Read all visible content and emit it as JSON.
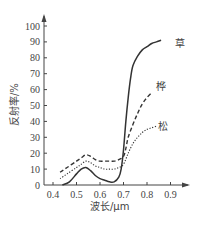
{
  "chart_data": {
    "type": "line",
    "title": "",
    "xlabel": "波长/μm",
    "ylabel": "反射率/%",
    "xlim": [
      0.4,
      0.9
    ],
    "ylim": [
      0,
      100
    ],
    "x_ticks": [
      "0.4",
      "0.5",
      "0.6",
      "0.7",
      "0.8",
      "0.9"
    ],
    "y_ticks": [
      "0",
      "10",
      "20",
      "30",
      "40",
      "50",
      "60",
      "70",
      "80",
      "90",
      "100"
    ],
    "grid": false,
    "legend_position": "inline labels at line ends",
    "series": [
      {
        "name": "草",
        "style": "solid",
        "x": [
          0.44,
          0.47,
          0.5,
          0.52,
          0.54,
          0.56,
          0.58,
          0.6,
          0.62,
          0.64,
          0.66,
          0.68,
          0.69,
          0.7,
          0.71,
          0.72,
          0.73,
          0.74,
          0.76,
          0.78,
          0.8,
          0.82,
          0.84,
          0.86
        ],
        "values": [
          0,
          2,
          7,
          10,
          11,
          9,
          6,
          4,
          3,
          2,
          2,
          5,
          10,
          22,
          40,
          55,
          67,
          75,
          81,
          85,
          87,
          89,
          90,
          91
        ]
      },
      {
        "name": "桦",
        "style": "dashed",
        "x": [
          0.43,
          0.46,
          0.5,
          0.52,
          0.54,
          0.56,
          0.58,
          0.6,
          0.62,
          0.64,
          0.66,
          0.68,
          0.7,
          0.71,
          0.72,
          0.74,
          0.76,
          0.78,
          0.8,
          0.82
        ],
        "values": [
          8,
          11,
          15,
          17,
          19,
          18,
          16,
          15,
          15,
          15,
          15,
          16,
          18,
          23,
          30,
          38,
          45,
          51,
          55,
          58
        ]
      },
      {
        "name": "松",
        "style": "dotted",
        "x": [
          0.43,
          0.46,
          0.5,
          0.52,
          0.54,
          0.56,
          0.58,
          0.6,
          0.62,
          0.64,
          0.66,
          0.68,
          0.7,
          0.72,
          0.74,
          0.76,
          0.78,
          0.8,
          0.82,
          0.84
        ],
        "values": [
          4,
          7,
          11,
          13,
          15,
          14,
          12,
          11,
          10,
          10,
          10,
          11,
          13,
          20,
          26,
          30,
          33,
          35,
          36,
          37
        ]
      }
    ]
  },
  "labels": {
    "grass": "草",
    "birch": "桦",
    "pine": "松",
    "xlabel": "波长/μm",
    "ylabel": "反射率/%"
  }
}
